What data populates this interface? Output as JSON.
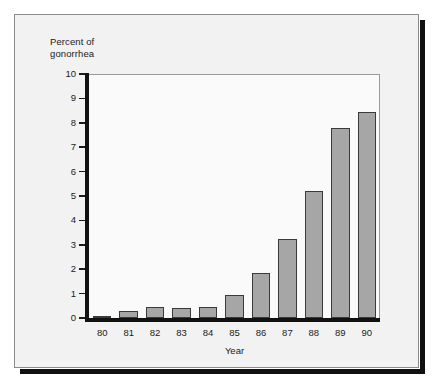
{
  "chart_data": {
    "type": "bar",
    "title": "",
    "subtitle": "",
    "xlabel": "Year",
    "ylabel": "Percent of\ngonorrhea",
    "ylabel_lines": [
      "Percent of",
      "gonorrhea"
    ],
    "categories": [
      "80",
      "81",
      "82",
      "83",
      "84",
      "85",
      "86",
      "87",
      "88",
      "89",
      "90"
    ],
    "values": [
      0.1,
      0.28,
      0.45,
      0.42,
      0.45,
      0.95,
      1.85,
      3.25,
      5.2,
      7.8,
      8.45
    ],
    "ylim": [
      0,
      10
    ],
    "xlim_labels": [
      "80",
      "90"
    ],
    "y_ticks": [
      0,
      1,
      2,
      3,
      4,
      5,
      6,
      7,
      8,
      9,
      10
    ],
    "y_tick_labels": [
      "0",
      "1",
      "2",
      "3",
      "4",
      "5",
      "6",
      "7",
      "8",
      "9",
      "10"
    ],
    "grid": false,
    "legend": null,
    "legend_position": "none",
    "series": [
      {
        "name": "Percent of gonorrhea",
        "values": [
          0.1,
          0.28,
          0.45,
          0.42,
          0.45,
          0.95,
          1.85,
          3.25,
          5.2,
          7.8,
          8.45
        ]
      }
    ],
    "colors": {
      "bar_fill": "#a6a6a6",
      "bar_edge": "#3a3a3a",
      "axis": "#111111",
      "plot_background": "#fafafa",
      "figure_background": "#f2f2f2",
      "frame_border": "#8a8a8a",
      "shadow": "#111111",
      "text": "#1b1b1b"
    }
  }
}
